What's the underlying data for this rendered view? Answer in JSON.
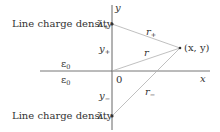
{
  "diagram": {
    "type": "geometry",
    "colors": {
      "axis": "#555555",
      "line": "#b0b0b0",
      "text": "#333333",
      "point": "#333333"
    },
    "labels": {
      "top_density": "Line charge density",
      "top_lambda": "λ",
      "top_lambda_sub": "+",
      "bottom_density": "Line charge density",
      "bottom_lambda": "λ",
      "bottom_lambda_sub": "−",
      "y_plus": "y",
      "y_plus_sub": "+",
      "y_minus": "y",
      "y_minus_sub": "−",
      "y_axis": "y",
      "x_axis": "x",
      "origin": "0",
      "eps_top": "ε",
      "eps_top_sub": "0",
      "eps_bottom": "ε",
      "eps_bottom_sub": "0",
      "r_plus": "r",
      "r_plus_sub": "+",
      "r": "r",
      "r_minus": "r",
      "r_minus_sub": "−",
      "point": "(x, y)"
    }
  }
}
